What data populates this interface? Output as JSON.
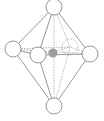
{
  "diagram": {
    "type": "octahedral-molecular-geometry",
    "colors": {
      "background": "#ffffff",
      "line": "#6b6b6b",
      "hidden_line": "#9a9a9a",
      "sphere_fill": "#ffffff",
      "sphere_stroke": "#6b6b6b",
      "central_atom": "#9e9e9e"
    },
    "central_atom": {
      "x": 53,
      "y": 53,
      "r": 4.5
    },
    "ligands": [
      {
        "id": "top",
        "x": 54,
        "y": 7,
        "r": 8,
        "hidden": false
      },
      {
        "id": "bottom",
        "x": 54,
        "y": 106,
        "r": 8,
        "hidden": false
      },
      {
        "id": "left",
        "x": 13,
        "y": 49,
        "r": 8,
        "hidden": false
      },
      {
        "id": "front",
        "x": 38,
        "y": 55,
        "r": 8,
        "hidden": false
      },
      {
        "id": "right",
        "x": 90,
        "y": 54,
        "r": 8,
        "hidden": false
      },
      {
        "id": "back",
        "x": 70,
        "y": 47,
        "r": 8,
        "hidden": true
      }
    ]
  }
}
